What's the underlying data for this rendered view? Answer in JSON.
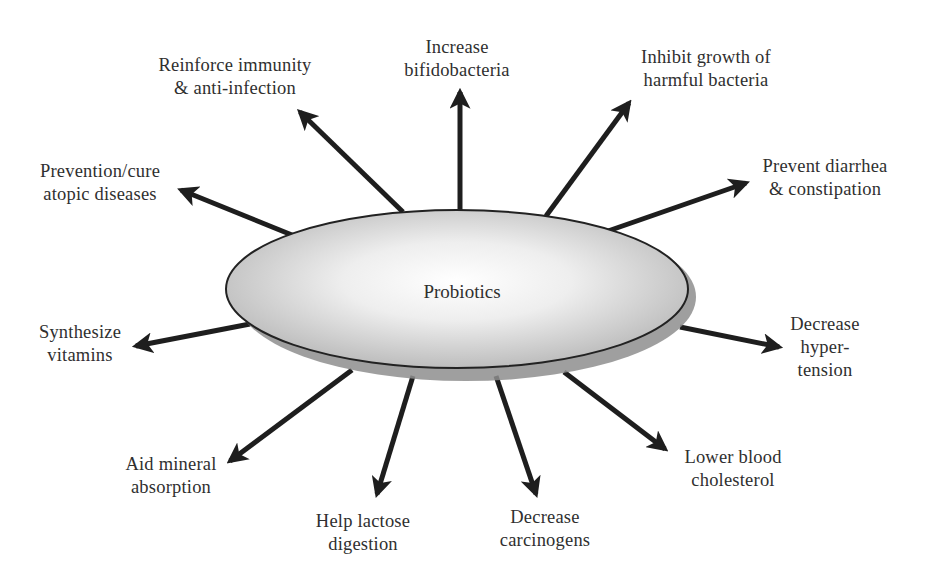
{
  "diagram": {
    "center": {
      "label": "Probiotics",
      "fill_center": "#ffffff",
      "fill_edge": "#c4c4c4",
      "shadow": "#8f8f8f",
      "stroke": "#222222"
    },
    "arrow_color": "#1e1e1e",
    "text_color": "#2f2f2f",
    "benefits": [
      {
        "id": "reinforce-immunity",
        "lines": [
          "Reinforce immunity",
          "& anti-infection"
        ],
        "direction": "up-left"
      },
      {
        "id": "increase-bifidobacteria",
        "lines": [
          "Increase",
          "bifidobacteria"
        ],
        "direction": "up"
      },
      {
        "id": "inhibit-harmful-bacteria",
        "lines": [
          "Inhibit growth of",
          "harmful bacteria"
        ],
        "direction": "up-right"
      },
      {
        "id": "prevent-diarrhea",
        "lines": [
          "Prevent diarrhea",
          "& constipation"
        ],
        "direction": "right-up"
      },
      {
        "id": "decrease-hypertension",
        "lines": [
          "Decrease",
          "hyper-",
          "tension"
        ],
        "direction": "right-down"
      },
      {
        "id": "lower-cholesterol",
        "lines": [
          "Lower blood",
          "cholesterol"
        ],
        "direction": "down-right"
      },
      {
        "id": "decrease-carcinogens",
        "lines": [
          "Decrease",
          "carcinogens"
        ],
        "direction": "down"
      },
      {
        "id": "help-lactose-digestion",
        "lines": [
          "Help lactose",
          "digestion"
        ],
        "direction": "down"
      },
      {
        "id": "aid-mineral-absorption",
        "lines": [
          "Aid mineral",
          "absorption"
        ],
        "direction": "down-left"
      },
      {
        "id": "synthesize-vitamins",
        "lines": [
          "Synthesize",
          "vitamins"
        ],
        "direction": "left-down"
      },
      {
        "id": "prevention-atopic-diseases",
        "lines": [
          "Prevention/cure",
          "atopic diseases"
        ],
        "direction": "left-up"
      }
    ]
  }
}
